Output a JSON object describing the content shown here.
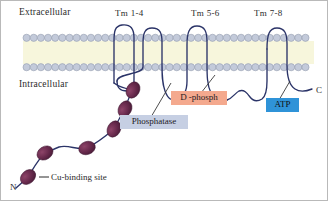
{
  "figure": {
    "background_color": "#ffffff",
    "border_color": "#b9b9b9"
  },
  "compartments": {
    "extracellular": "Extracellular",
    "intracellular": "Intracellular"
  },
  "membrane": {
    "head_color": "#c3cada",
    "head_stroke": "#8e96a8",
    "interior_color": "#f7f6dc",
    "tail_color": "#2a2a26",
    "x_start": 22,
    "x_end": 313,
    "y_top": 33,
    "y_bottom": 70
  },
  "transmembrane_labels": [
    {
      "id": "tm-1-4",
      "label": "Tm  1-4",
      "x": 122,
      "y": 11
    },
    {
      "id": "tm-5-6",
      "label": "Tm  5-6",
      "x": 194,
      "y": 11
    },
    {
      "id": "tm-7-8",
      "label": "Tm  7-8",
      "x": 257,
      "y": 11
    }
  ],
  "termini": [
    {
      "id": "n-terminus",
      "label": "N",
      "x": 10,
      "y": 184
    },
    {
      "id": "c-terminus",
      "label": "C",
      "x": 314,
      "y": 87
    }
  ],
  "protein": {
    "stroke_color": "#2b3468",
    "stroke_width": 1.3,
    "helix_count": 8
  },
  "cu_binding": {
    "label": "Cu-binding site",
    "label_x": 50,
    "label_y": 178,
    "fill_color": "#5e2546",
    "highlight_color": "#8d4468",
    "site_count": 6,
    "sites": [
      {
        "cx": 132,
        "cy": 89,
        "rx": 8.5,
        "ry": 6.5,
        "rot": -62
      },
      {
        "cx": 124,
        "cy": 108,
        "rx": 8.5,
        "ry": 6.5,
        "rot": -62
      },
      {
        "cx": 113,
        "cy": 128,
        "rx": 8.5,
        "ry": 6.5,
        "rot": -62
      },
      {
        "cx": 86,
        "cy": 147,
        "rx": 8.5,
        "ry": 6.5,
        "rot": -20
      },
      {
        "cx": 44,
        "cy": 152,
        "rx": 8.5,
        "ry": 6.5,
        "rot": -32
      },
      {
        "cx": 27,
        "cy": 176,
        "rx": 8.5,
        "ry": 6.5,
        "rot": -42
      }
    ]
  },
  "callouts": [
    {
      "id": "d-phosph",
      "label": "D -phosph",
      "color": "#f4a98e",
      "x": 170,
      "y": 94,
      "width": 56,
      "leader_from": [
        198,
        94
      ],
      "leader_to": [
        214,
        74
      ]
    },
    {
      "id": "phosphatase",
      "label": "Phosphatase",
      "color": "#c6cfe3",
      "x": 119,
      "y": 118,
      "width": 66,
      "leader_from": [
        146,
        118
      ],
      "leader_to": [
        168,
        82
      ]
    },
    {
      "id": "atp",
      "label": "ATP",
      "color": "#2f93d8",
      "x": 265,
      "y": 101,
      "width": 32,
      "leader_from": [
        277,
        101
      ],
      "leader_to": [
        288,
        80
      ]
    }
  ]
}
